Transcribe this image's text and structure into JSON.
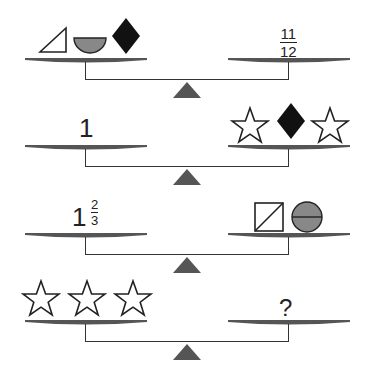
{
  "colors": {
    "pan": "#555555",
    "fulcrum": "#555555",
    "gray_fill": "#888888",
    "black_fill": "#111111",
    "line": "#333333"
  },
  "scales": [
    {
      "left": {
        "items": [
          "triangle-icon",
          "bowl-icon",
          "black-diamond-icon"
        ]
      },
      "right": {
        "fraction": {
          "numerator": "11",
          "denominator": "12"
        }
      }
    },
    {
      "left": {
        "number": "1"
      },
      "right": {
        "items": [
          "star-icon",
          "black-diamond-icon",
          "star-icon"
        ]
      }
    },
    {
      "left": {
        "whole": "1",
        "fraction": {
          "numerator": "2",
          "denominator": "3"
        }
      },
      "right": {
        "items": [
          "square-diagonal-icon",
          "circle-halved-icon"
        ]
      }
    },
    {
      "left": {
        "items": [
          "star-icon",
          "star-icon",
          "star-icon"
        ]
      },
      "right": {
        "unknown": "?"
      }
    }
  ]
}
